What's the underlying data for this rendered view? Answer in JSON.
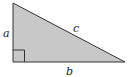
{
  "diagram": {
    "type": "right-triangle",
    "fill_color": "#c8c8c8",
    "stroke_color": "#333333",
    "vertices": {
      "top": [
        13,
        3
      ],
      "bottom_left": [
        13,
        62
      ],
      "bottom_right": [
        125,
        62
      ]
    },
    "labels": {
      "a": "a",
      "b": "b",
      "c": "c"
    },
    "right_angle_marker": true
  }
}
